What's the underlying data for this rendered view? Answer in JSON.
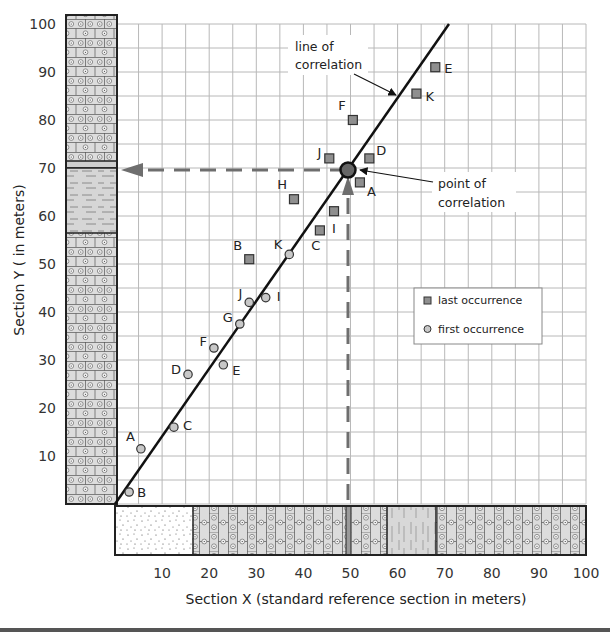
{
  "chart_data": {
    "type": "scatter",
    "title": "",
    "xlabel": "Section X (standard reference section in meters)",
    "ylabel": "Section Y ( in meters)",
    "xlim": [
      0,
      100
    ],
    "ylim": [
      0,
      100
    ],
    "x_ticks": [
      "10",
      "20",
      "30",
      "40",
      "50",
      "60",
      "70",
      "80",
      "90",
      "100"
    ],
    "y_ticks": [
      "10",
      "20",
      "30",
      "40",
      "50",
      "60",
      "70",
      "80",
      "90",
      "100"
    ],
    "grid": true,
    "grid_step": 5,
    "legend": {
      "position": "right-middle",
      "entries": [
        {
          "name": "last occurrence",
          "marker": "square",
          "color": "#8f8f8f"
        },
        {
          "name": "first occurrence",
          "marker": "circle",
          "color": "#c4c4c4"
        }
      ]
    },
    "series": [
      {
        "name": "last occurrence",
        "marker": "square",
        "points": [
          {
            "label": "A",
            "x": 52,
            "y": 67
          },
          {
            "label": "B",
            "x": 28.5,
            "y": 51
          },
          {
            "label": "C",
            "x": 43.5,
            "y": 57
          },
          {
            "label": "D",
            "x": 54,
            "y": 72
          },
          {
            "label": "E",
            "x": 68,
            "y": 91
          },
          {
            "label": "F",
            "x": 50.5,
            "y": 80
          },
          {
            "label": "H",
            "x": 38,
            "y": 63.5
          },
          {
            "label": "I",
            "x": 46.5,
            "y": 61
          },
          {
            "label": "J",
            "x": 45.5,
            "y": 72
          },
          {
            "label": "K",
            "x": 64,
            "y": 85.5
          }
        ]
      },
      {
        "name": "first occurrence",
        "marker": "circle",
        "points": [
          {
            "label": "A",
            "x": 5.5,
            "y": 11.5
          },
          {
            "label": "B",
            "x": 3,
            "y": 2.5
          },
          {
            "label": "C",
            "x": 12.5,
            "y": 16
          },
          {
            "label": "D",
            "x": 15.5,
            "y": 27
          },
          {
            "label": "E",
            "x": 23,
            "y": 29
          },
          {
            "label": "F",
            "x": 21,
            "y": 32.5
          },
          {
            "label": "G",
            "x": 26.5,
            "y": 37.5
          },
          {
            "label": "I",
            "x": 32,
            "y": 43
          },
          {
            "label": "J",
            "x": 28.5,
            "y": 42
          },
          {
            "label": "K",
            "x": 37,
            "y": 52
          }
        ]
      }
    ],
    "line_of_correlation": {
      "from": {
        "x": 0,
        "y": 0
      },
      "to": {
        "x": 71,
        "y": 100
      }
    },
    "point_of_correlation": {
      "x": 50,
      "y": 70
    },
    "annotations": [
      {
        "text": "line of correlation",
        "lines": [
          "line of",
          "correlation"
        ]
      },
      {
        "text": "point of correlation",
        "lines": [
          "point of",
          "correlation"
        ]
      }
    ],
    "section_y_column": [
      {
        "from": 0,
        "to": 56,
        "lithology": "limestone-oolitic"
      },
      {
        "from": 56,
        "to": 70,
        "lithology": "shale"
      },
      {
        "from": 70,
        "to": 71.5,
        "lithology": "marker-bed"
      },
      {
        "from": 71.5,
        "to": 100,
        "lithology": "limestone-oolitic"
      }
    ],
    "section_x_column": [
      {
        "from": 0,
        "to": 16.5,
        "lithology": "sandstone"
      },
      {
        "from": 16.5,
        "to": 49,
        "lithology": "limestone-oolitic"
      },
      {
        "from": 49,
        "to": 51,
        "lithology": "marker-bed"
      },
      {
        "from": 51,
        "to": 58.5,
        "lithology": "limestone-oolitic"
      },
      {
        "from": 58.5,
        "to": 69,
        "lithology": "shale-siltstone"
      },
      {
        "from": 69,
        "to": 100,
        "lithology": "limestone-oolitic"
      }
    ]
  },
  "labels": {
    "xlabel": "Section X (standard reference section in meters)",
    "ylabel": "Section Y ( in meters)",
    "line_anno_1": "line of",
    "line_anno_2": "correlation",
    "point_anno_1": "point of",
    "point_anno_2": "correlation",
    "legend_last": "last occurrence",
    "legend_first": "first occurrence"
  },
  "colors": {
    "grid": "#b8b8b8",
    "line": "#111111",
    "square_fill": "#8f8f8f",
    "circle_fill": "#c8c8c8",
    "dash_arrow": "#6e6e6e",
    "column_fill": "#dcdcdc"
  }
}
